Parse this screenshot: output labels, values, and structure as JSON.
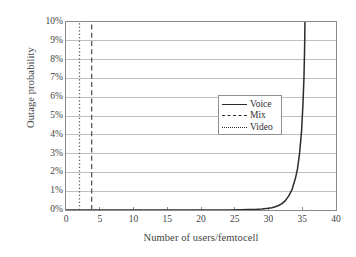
{
  "chart_data": {
    "type": "line",
    "title": "",
    "xlabel": "Number of users/femtocell",
    "ylabel": "Outage probability",
    "xlim": [
      0,
      40
    ],
    "ylim": [
      0,
      10
    ],
    "xticks": [
      "0",
      "5",
      "10",
      "15",
      "20",
      "25",
      "30",
      "35",
      "40"
    ],
    "xtick_values": [
      0,
      5,
      10,
      15,
      20,
      25,
      30,
      35,
      40
    ],
    "yticks": [
      "0%",
      "1%",
      "2%",
      "3%",
      "4%",
      "5%",
      "6%",
      "7%",
      "8%",
      "9%",
      "10%"
    ],
    "ytick_values": [
      0,
      1,
      2,
      3,
      4,
      5,
      6,
      7,
      8,
      9,
      10
    ],
    "grid": "horizontal",
    "legend_position": "center",
    "series": [
      {
        "name": "Voice",
        "style": "solid",
        "color": "#2c2c2c",
        "x": [
          0,
          5,
          10,
          15,
          20,
          22,
          24,
          26,
          27,
          28,
          29,
          30,
          30.5,
          31,
          31.5,
          32,
          32.5,
          33,
          33.5,
          34,
          34.3,
          34.6,
          34.9,
          35.1,
          35.25,
          35.35,
          35.4
        ],
        "y": [
          0,
          0,
          0,
          0,
          0,
          0,
          0,
          0.01,
          0.02,
          0.03,
          0.05,
          0.09,
          0.12,
          0.17,
          0.24,
          0.34,
          0.5,
          0.75,
          1.1,
          1.7,
          2.2,
          3.0,
          4.2,
          5.6,
          7.0,
          8.6,
          10.0
        ]
      },
      {
        "name": "Mix",
        "style": "dashed",
        "color": "#595959",
        "x": [
          3.8,
          3.8
        ],
        "y": [
          0,
          10
        ]
      },
      {
        "name": "Video",
        "style": "dotted",
        "color": "#595959",
        "x": [
          2.0,
          2.0
        ],
        "y": [
          0,
          10
        ]
      }
    ],
    "legend": [
      {
        "label": "Voice",
        "style": "solid"
      },
      {
        "label": "Mix",
        "style": "dashed"
      },
      {
        "label": "Video",
        "style": "dotted"
      }
    ],
    "colors": {
      "gridline": "#bfbfbf",
      "axis": "#8a8a8a",
      "background": "#ffffff",
      "text": "#3f3f3f"
    }
  }
}
